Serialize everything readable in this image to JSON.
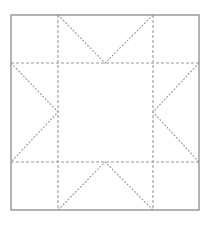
{
  "diagram": {
    "type": "quilt-block-pattern",
    "colors": {
      "background": "#ffffff",
      "outline": "#8a8a8a",
      "seam": "#9a9a9a"
    },
    "outer_square": {
      "x1": 11,
      "y1": 15,
      "x2": 199,
      "y2": 210
    },
    "grid": {
      "cols": [
        11,
        58,
        153,
        199
      ],
      "rows": [
        15,
        63,
        162,
        210
      ]
    },
    "star_points": [
      {
        "side": "top",
        "from": [
          58,
          15
        ],
        "apex": [
          105,
          63
        ],
        "to": [
          153,
          15
        ]
      },
      {
        "side": "right",
        "from": [
          199,
          63
        ],
        "apex": [
          153,
          112
        ],
        "to": [
          199,
          162
        ]
      },
      {
        "side": "bottom",
        "from": [
          58,
          210
        ],
        "apex": [
          105,
          162
        ],
        "to": [
          153,
          210
        ]
      },
      {
        "side": "left",
        "from": [
          11,
          63
        ],
        "apex": [
          58,
          112
        ],
        "to": [
          11,
          162
        ]
      }
    ]
  }
}
